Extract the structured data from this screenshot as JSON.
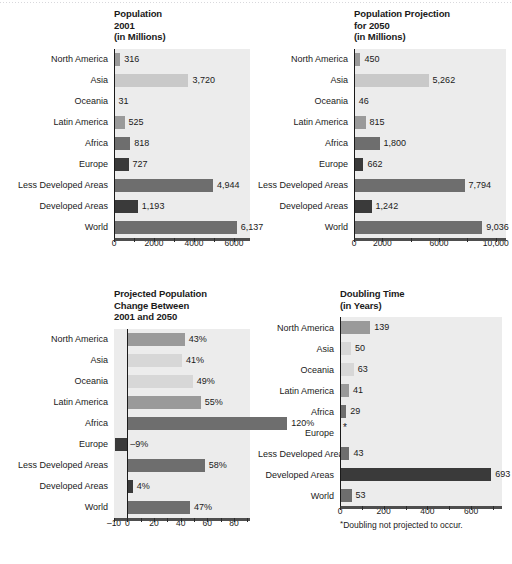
{
  "categories": [
    "North America",
    "Asia",
    "Oceania",
    "Latin America",
    "Africa",
    "Europe",
    "Less Developed Areas",
    "Developed Areas",
    "World"
  ],
  "colors": {
    "light": "#c9c9c9",
    "lighter": "#d7d7d7",
    "mid": "#9a9a9a",
    "dark": "#6e6e6e",
    "darker": "#4a4a4a",
    "darkest": "#3a3a3a",
    "plot_bg": "#ececec",
    "axis": "#4e4e4e"
  },
  "panels": {
    "pop2001": {
      "title": "Population\n2001\n(in Millions)"
    },
    "proj2050": {
      "title": "Population Projection\nfor 2050\n(in Millions)"
    },
    "change": {
      "title": "Projected Population\nChange Between\n2001 and 2050"
    },
    "doubling": {
      "title": "Doubling Time\n(in Years)",
      "footnote": "Doubling not projected to occur.",
      "footnote_marker": "*"
    }
  },
  "chart_data": [
    {
      "type": "bar",
      "id": "pop2001",
      "orientation": "horizontal",
      "title": "Population 2001 (in Millions)",
      "xlabel": "",
      "ylabel": "",
      "xlim": [
        0,
        7000
      ],
      "grid": false,
      "legend": "none",
      "categories": [
        "North America",
        "Asia",
        "Oceania",
        "Latin America",
        "Africa",
        "Europe",
        "Less Developed Areas",
        "Developed Areas",
        "World"
      ],
      "values": [
        316,
        3720,
        31,
        525,
        818,
        727,
        4944,
        1193,
        6137
      ],
      "labels": [
        "316",
        "3,720",
        "31",
        "525",
        "818",
        "727",
        "4,944",
        "1,193",
        "6,137"
      ],
      "tick_labels": [
        "0",
        "2000",
        "4000",
        "6000"
      ],
      "tick_values": [
        0,
        2000,
        4000,
        6000
      ],
      "minor_tick_values": [
        1000,
        3000,
        5000
      ]
    },
    {
      "type": "bar",
      "id": "proj2050",
      "orientation": "horizontal",
      "title": "Population Projection for 2050 (in Millions)",
      "xlabel": "",
      "ylabel": "",
      "xlim": [
        0,
        11000
      ],
      "grid": false,
      "legend": "none",
      "categories": [
        "North America",
        "Asia",
        "Oceania",
        "Latin America",
        "Africa",
        "Europe",
        "Less Developed Areas",
        "Developed Areas",
        "World"
      ],
      "values": [
        450,
        5262,
        46,
        815,
        1800,
        662,
        7794,
        1242,
        9036
      ],
      "labels": [
        "450",
        "5,262",
        "46",
        "815",
        "1,800",
        "662",
        "7,794",
        "1,242",
        "9,036"
      ],
      "tick_labels": [
        "0",
        "2000",
        "6000",
        "10,000"
      ],
      "tick_values": [
        0,
        2000,
        6000,
        10000
      ],
      "minor_tick_values": [
        4000,
        8000
      ]
    },
    {
      "type": "bar",
      "id": "change",
      "orientation": "horizontal",
      "title": "Projected Population Change Between 2001 and 2050",
      "xlabel": "",
      "ylabel": "",
      "xlim": [
        -10,
        95
      ],
      "unit": "%",
      "grid": false,
      "legend": "none",
      "categories": [
        "North America",
        "Asia",
        "Oceania",
        "Latin America",
        "Africa",
        "Europe",
        "Less Developed Areas",
        "Developed Areas",
        "World"
      ],
      "values": [
        43,
        41,
        49,
        55,
        120,
        -9,
        58,
        4,
        47
      ],
      "labels": [
        "43%",
        "41%",
        "49%",
        "55%",
        "120%",
        "–9%",
        "58%",
        "4%",
        "47%"
      ],
      "tick_labels": [
        "-10",
        "0",
        "20",
        "40",
        "60",
        "80"
      ],
      "tick_values": [
        -10,
        0,
        20,
        40,
        60,
        80
      ],
      "minor_tick_values": [
        10,
        30,
        50,
        70,
        90
      ]
    },
    {
      "type": "bar",
      "id": "doubling",
      "orientation": "horizontal",
      "title": "Doubling Time (in Years)",
      "xlabel": "",
      "ylabel": "",
      "xlim": [
        0,
        760
      ],
      "grid": false,
      "legend": "none",
      "categories": [
        "North America",
        "Asia",
        "Oceania",
        "Latin America",
        "Africa",
        "Europe",
        "Less Developed Areas",
        "Developed Areas",
        "World"
      ],
      "values": [
        139,
        50,
        63,
        41,
        29,
        null,
        43,
        693,
        53
      ],
      "labels": [
        "139",
        "50",
        "63",
        "41",
        "29",
        "*",
        "43",
        "693",
        "53"
      ],
      "tick_labels": [
        "0",
        "200",
        "400",
        "600"
      ],
      "tick_values": [
        0,
        200,
        400,
        600
      ],
      "minor_tick_values": [
        100,
        300,
        500,
        700
      ],
      "annotation": "* Doubling not projected to occur."
    }
  ]
}
